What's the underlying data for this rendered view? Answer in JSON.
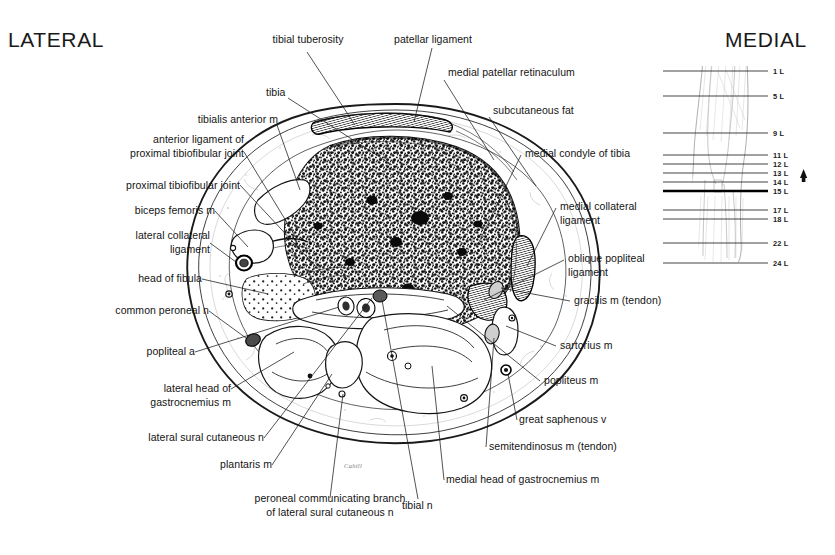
{
  "page": {
    "headers": {
      "lateral": "LATERAL",
      "medial": "MEDIAL"
    },
    "signature": "Cahill"
  },
  "labels": {
    "left": [
      {
        "id": "tibialis-anterior-m",
        "text": "tibialis anterior m"
      },
      {
        "id": "anterior-ligament-of-proximal-tibiofibular-joint",
        "text": "anterior ligament of\nproximal tibiofibular joint"
      },
      {
        "id": "proximal-tibiofibular-joint",
        "text": "proximal tibiofibular joint"
      },
      {
        "id": "biceps-femoris-m",
        "text": "biceps femoris m"
      },
      {
        "id": "lateral-collateral-ligament",
        "text": "lateral collateral\nligament"
      },
      {
        "id": "head-of-fibula",
        "text": "head of fibula"
      },
      {
        "id": "common-peroneal-n",
        "text": "common peroneal n"
      },
      {
        "id": "popliteal-a",
        "text": "popliteal a"
      },
      {
        "id": "lateral-head-of-gastrocnemius-m",
        "text": "lateral head of\ngastrocnemius m"
      },
      {
        "id": "lateral-sural-cutaneous-n",
        "text": "lateral sural cutaneous n"
      },
      {
        "id": "plantaris-m",
        "text": "plantaris m"
      }
    ],
    "top": [
      {
        "id": "tibial-tuberosity",
        "text": "tibial tuberosity"
      },
      {
        "id": "tibia",
        "text": "tibia"
      },
      {
        "id": "patellar-ligament",
        "text": "patellar ligament"
      }
    ],
    "right": [
      {
        "id": "medial-patellar-retinaculum",
        "text": "medial patellar retinaculum"
      },
      {
        "id": "subcutaneous-fat",
        "text": "subcutaneous fat"
      },
      {
        "id": "medial-condyle-of-tibia",
        "text": "medial condyle of tibia"
      },
      {
        "id": "medial-collateral-ligament",
        "text": "medial collateral\nligament"
      },
      {
        "id": "oblique-popliteal-ligament",
        "text": "oblique popliteal\nligament"
      },
      {
        "id": "gracilis-m-tendon",
        "text": "gracilis m (tendon)"
      },
      {
        "id": "sartorius-m",
        "text": "sartorius m"
      },
      {
        "id": "popliteus-m",
        "text": "popliteus m"
      },
      {
        "id": "great-saphenous-v",
        "text": "great saphenous v"
      },
      {
        "id": "semitendinosus-m-tendon",
        "text": "semitendinosus m (tendon)"
      },
      {
        "id": "medial-head-of-gastrocnemius-m",
        "text": "medial head of gastrocnemius m"
      }
    ],
    "bottom": [
      {
        "id": "peroneal-communicating-branch",
        "text": "peroneal communicating branch\nof lateral sural cutaneous n"
      },
      {
        "id": "tibial-n",
        "text": "tibial n"
      }
    ]
  },
  "level_diagram": {
    "levels": [
      {
        "label": "1 L",
        "y": 71,
        "bold": false
      },
      {
        "label": "5 L",
        "y": 96,
        "bold": false
      },
      {
        "label": "9 L",
        "y": 133,
        "bold": false
      },
      {
        "label": "11 L",
        "y": 155,
        "bold": false
      },
      {
        "label": "12 L",
        "y": 164,
        "bold": false
      },
      {
        "label": "13 L",
        "y": 173,
        "bold": false
      },
      {
        "label": "14 L",
        "y": 182,
        "bold": false
      },
      {
        "label": "15 L",
        "y": 191,
        "bold": true
      },
      {
        "label": "17 L",
        "y": 210,
        "bold": false
      },
      {
        "label": "18 L",
        "y": 219,
        "bold": false
      },
      {
        "label": "22 L",
        "y": 243,
        "bold": false
      },
      {
        "label": "24 L",
        "y": 263,
        "bold": false
      }
    ],
    "current_level_marker": "arrow",
    "current_level": "13 L"
  },
  "colors": {
    "ink": "#141414",
    "background": "#ffffff",
    "fat_tone": "#c8c8c8",
    "tendon_tone": "#cfcfcf",
    "level_line": "#222222"
  }
}
